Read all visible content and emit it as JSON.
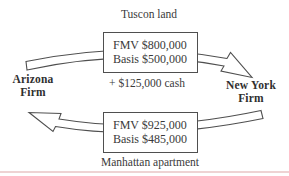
{
  "figure": {
    "top_label": "Tuscon land",
    "top_box": {
      "fmv": "FMV $800,000",
      "basis": "Basis $500,000"
    },
    "cash": "+ $125,000 cash",
    "left_party": "Arizona Firm",
    "right_party": "New York Firm",
    "bottom_box": {
      "fmv": "FMV $925,000",
      "basis": "Basis $485,000"
    },
    "bottom_label": "Manhattan apartment",
    "arrows": [
      {
        "name": "top-arrow",
        "from": "Arizona Firm",
        "to": "New York Firm"
      },
      {
        "name": "bottom-arrow",
        "from": "New York Firm",
        "to": "Arizona Firm"
      }
    ],
    "colors": {
      "text": "#3a3a3a",
      "line": "#4f4f4f",
      "rule": "#eed3d3",
      "background": "#ffffff"
    }
  }
}
